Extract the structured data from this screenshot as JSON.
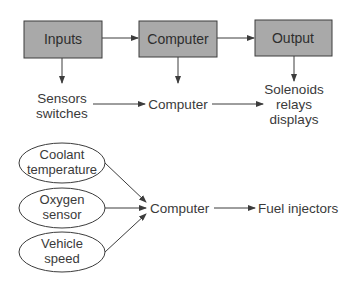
{
  "colors": {
    "box_fill": "#a9a9a9",
    "box_stroke": "#3c3c3c",
    "line": "#3c3c3c",
    "text": "#3a3a3a",
    "background": "#ffffff"
  },
  "top_flow": {
    "boxes": [
      {
        "id": "inputs",
        "label": "Inputs"
      },
      {
        "id": "computer",
        "label": "Computer"
      },
      {
        "id": "output",
        "label": "Output"
      }
    ]
  },
  "middle_flow": {
    "items": [
      {
        "id": "sensors",
        "lines": [
          "Sensors",
          "switches"
        ]
      },
      {
        "id": "computer",
        "lines": [
          "Computer"
        ]
      },
      {
        "id": "solenoids",
        "lines": [
          "Solenoids",
          "relays",
          "displays"
        ]
      }
    ]
  },
  "bottom_flow": {
    "inputs": [
      {
        "id": "coolant",
        "lines": [
          "Coolant",
          "temperature"
        ]
      },
      {
        "id": "oxygen",
        "lines": [
          "Oxygen",
          "sensor"
        ]
      },
      {
        "id": "vehicle",
        "lines": [
          "Vehicle",
          "speed"
        ]
      }
    ],
    "computer": "Computer",
    "output": "Fuel injectors"
  }
}
